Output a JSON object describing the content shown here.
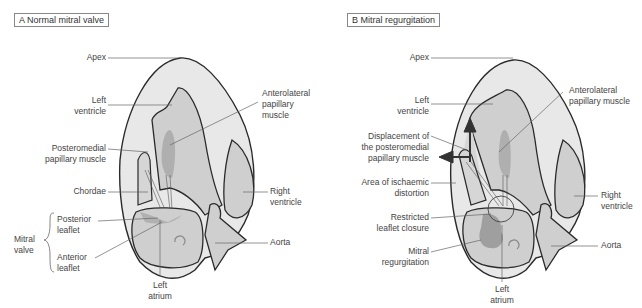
{
  "panels": {
    "a": {
      "title": "A Normal mitral valve",
      "labels": {
        "apex": "Apex",
        "left_ventricle": [
          "Left",
          "ventricle"
        ],
        "anterolateral": [
          "Anterolateral",
          "papillary",
          "muscle"
        ],
        "posteromedial": [
          "Posteromedial",
          "papillary muscle"
        ],
        "chordae": "Chordae",
        "right_ventricle": [
          "Right",
          "ventricle"
        ],
        "mitral_valve": [
          "Mitral",
          "valve"
        ],
        "posterior_leaflet": [
          "Posterior",
          "leaflet"
        ],
        "anterior_leaflet": [
          "Anterior",
          "leaflet"
        ],
        "aorta": "Aorta",
        "left_atrium": [
          "Left",
          "atrium"
        ]
      }
    },
    "b": {
      "title": "B Mitral regurgitation",
      "labels": {
        "apex": "Apex",
        "left_ventricle": [
          "Left",
          "ventricle"
        ],
        "anterolateral": [
          "Anterolateral",
          "papillary muscle"
        ],
        "displacement": [
          "Displacement of",
          "the posteromedial",
          "papillary muscle"
        ],
        "ischaemic": [
          "Area of ischaemic",
          "distortion"
        ],
        "restricted": [
          "Restricted",
          "leaflet closure"
        ],
        "regurgitation": [
          "Mitral",
          "regurgitation"
        ],
        "right_ventricle": [
          "Right",
          "ventricle"
        ],
        "aorta": "Aorta",
        "left_atrium": [
          "Left",
          "atrium"
        ]
      }
    }
  },
  "colors": {
    "outer_tissue": "#e8e8e8",
    "cavity": "#cfcfcf",
    "dark_muscle": "#a9a9a9",
    "outline": "#2a2a2a",
    "leader": "#666666"
  }
}
